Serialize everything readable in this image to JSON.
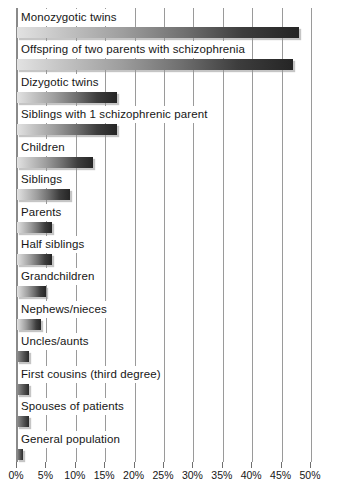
{
  "chart_data": {
    "type": "bar",
    "orientation": "horizontal",
    "title": "",
    "xlabel": "",
    "ylabel": "",
    "xlim": [
      0,
      50
    ],
    "xticks": [
      "0%",
      "5%",
      "10%",
      "15%",
      "20%",
      "25%",
      "30%",
      "35%",
      "40%",
      "45%",
      "50%"
    ],
    "xtick_values": [
      0,
      5,
      10,
      15,
      20,
      25,
      30,
      35,
      40,
      45,
      50
    ],
    "grid": true,
    "legend": "none",
    "value_suffix": "%",
    "categories": [
      "Monozygotic twins",
      "Offspring of two parents with schizophrenia",
      "Dizygotic twins",
      "Siblings with 1 schizophrenic parent",
      "Children",
      "Siblings",
      "Parents",
      "Half siblings",
      "Grandchildren",
      "Nephews/nieces",
      "Uncles/aunts",
      "First cousins (third degree)",
      "Spouses of patients",
      "General population"
    ],
    "values": [
      48,
      47,
      17,
      17,
      13,
      9,
      6,
      6,
      5,
      4,
      2,
      2,
      2,
      1
    ]
  },
  "axis": {
    "ticks": [
      {
        "label": "0%",
        "value": 0
      },
      {
        "label": "5%",
        "value": 5
      },
      {
        "label": "10%",
        "value": 10
      },
      {
        "label": "15%",
        "value": 15
      },
      {
        "label": "20%",
        "value": 20
      },
      {
        "label": "25%",
        "value": 25
      },
      {
        "label": "30%",
        "value": 30
      },
      {
        "label": "35%",
        "value": 35
      },
      {
        "label": "40%",
        "value": 40
      },
      {
        "label": "45%",
        "value": 45
      },
      {
        "label": "50%",
        "value": 50
      }
    ]
  },
  "colors": {
    "bar_start": "#e2e2e2",
    "bar_end": "#252525",
    "gridline": "#9a9a9a",
    "axis": "#8a8a8a",
    "text": "#161616",
    "background": "#ffffff"
  }
}
